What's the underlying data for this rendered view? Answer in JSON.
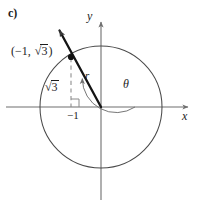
{
  "figure": {
    "part_label": "c)",
    "colors": {
      "ink": "#1c1c1c",
      "axis": "#6f6f6f",
      "circle": "#4a4a4a",
      "ray": "#141414",
      "dashed": "#8a8a8a",
      "background": "#ffffff"
    },
    "geometry": {
      "origin": {
        "x": 101,
        "y": 107
      },
      "circle_radius": 61,
      "point": {
        "x": 71,
        "y": 57
      },
      "ray_tip": {
        "x": 57,
        "y": 28
      },
      "foot_of_perpendicular": {
        "x": 71,
        "y": 107
      },
      "theta_arc_radius": 34,
      "x_axis": {
        "x1": 6,
        "x2": 192,
        "y": 107
      },
      "y_axis": {
        "x": 101,
        "y1": 18,
        "y2": 200
      }
    },
    "labels": {
      "point_coords_open": "(",
      "point_coords_x": "−1,",
      "point_coords_radical_sign": "√",
      "point_coords_radicand": "3",
      "point_coords_close": ")",
      "leg_radical_sign": "√",
      "leg_radicand": "3",
      "x_intercept": "−1",
      "radius": "r",
      "angle": "θ",
      "x_axis": "x",
      "y_axis": "y"
    }
  }
}
